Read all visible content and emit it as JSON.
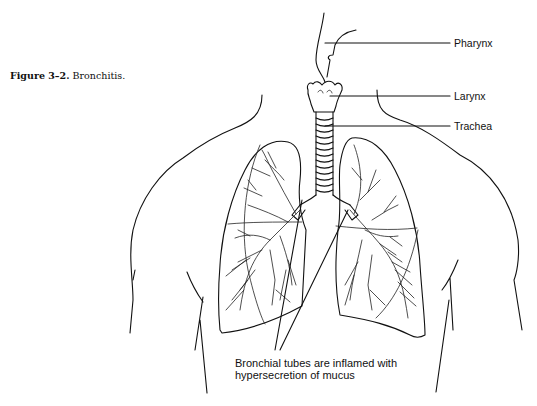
{
  "figure": {
    "number_label": "Figure 3–2.",
    "title": "Bronchitis."
  },
  "labels": {
    "pharynx": "Pharynx",
    "larynx": "Larynx",
    "trachea": "Trachea"
  },
  "annotation": {
    "line1": "Bronchial tubes are inflamed with",
    "line2": "hypersecretion of mucus"
  }
}
